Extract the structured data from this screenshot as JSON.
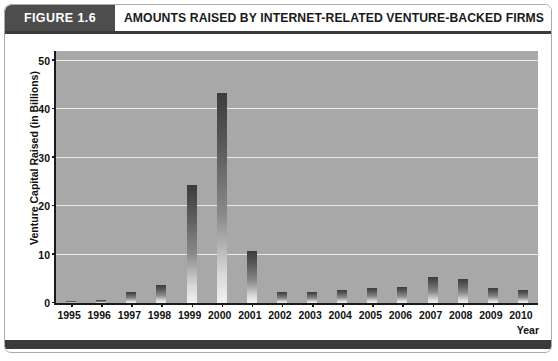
{
  "figure": {
    "number_label": "FIGURE 1.6",
    "title": "AMOUNTS RAISED BY INTERNET-RELATED VENTURE-BACKED FIRMS"
  },
  "colors": {
    "header_badge": "#4d4d4d",
    "header_rule": "#3a3a3a",
    "plot_background": "#a8a8a8",
    "gridline": "#e8e8e8",
    "bar_top": "#3c3c3c",
    "bar_bottom": "#f2f2f2",
    "axis": "#1a1a1a",
    "footer_bar": "#3a3a3a"
  },
  "chart_data": {
    "type": "bar",
    "title": "AMOUNTS RAISED BY INTERNET-RELATED VENTURE-BACKED FIRMS",
    "xlabel": "Year",
    "ylabel": "Venture Capital Raised (in Billions)",
    "categories": [
      "1995",
      "1996",
      "1997",
      "1998",
      "1999",
      "2000",
      "2001",
      "2002",
      "2003",
      "2004",
      "2005",
      "2006",
      "2007",
      "2008",
      "2009",
      "2010"
    ],
    "values": [
      0.5,
      0.7,
      2.2,
      3.8,
      24.4,
      43.3,
      10.8,
      2.3,
      2.2,
      2.6,
      3.1,
      3.3,
      5.3,
      5.0,
      3.2,
      2.6
    ],
    "ylim": [
      0,
      52
    ],
    "yticks": [
      0,
      10,
      20,
      30,
      40,
      50
    ],
    "ytick_labels": [
      "0",
      "10",
      "20",
      "30",
      "40",
      "50"
    ],
    "grid": true,
    "legend": "none"
  }
}
